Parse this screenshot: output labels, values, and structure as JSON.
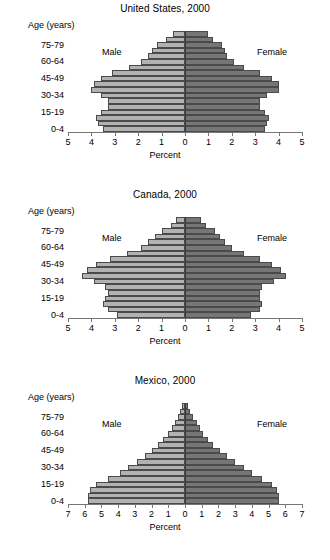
{
  "figure": {
    "axis_titles": {
      "x": "Percent",
      "y": "Age (years)"
    },
    "series_labels": {
      "male": "Male",
      "female": "Female"
    },
    "colors": {
      "male": "#b2b2b2",
      "female": "#767676",
      "outline": "#4a4a4a",
      "axis": "#777777"
    }
  },
  "chart_data": [
    {
      "type": "bar",
      "title": "United States, 2000",
      "xlabel": "Percent",
      "ylabel": "Age (years)",
      "orientation": "population-pyramid",
      "xlim": [
        -5,
        5
      ],
      "xticks": [
        5,
        4,
        3,
        2,
        1,
        0,
        1,
        2,
        3,
        4,
        5
      ],
      "grid": false,
      "legend": "inline",
      "categories": [
        "0-4",
        "5-9",
        "10-14",
        "15-19",
        "20-24",
        "25-29",
        "30-34",
        "35-39",
        "40-44",
        "45-49",
        "50-54",
        "55-59",
        "60-64",
        "65-69",
        "70-74",
        "75-79",
        "80-84",
        "85+"
      ],
      "ytick_labels": [
        "0-4",
        "15-19",
        "30-34",
        "45-49",
        "60-64",
        "75-79"
      ],
      "series": [
        {
          "name": "Male",
          "values": [
            3.5,
            3.7,
            3.8,
            3.6,
            3.3,
            3.3,
            3.6,
            4.0,
            3.9,
            3.6,
            3.1,
            2.4,
            1.9,
            1.6,
            1.4,
            1.2,
            0.8,
            0.5
          ]
        },
        {
          "name": "Female",
          "values": [
            3.4,
            3.5,
            3.6,
            3.4,
            3.2,
            3.2,
            3.5,
            4.0,
            4.0,
            3.7,
            3.2,
            2.5,
            2.1,
            1.8,
            1.7,
            1.6,
            1.2,
            1.0
          ]
        }
      ]
    },
    {
      "type": "bar",
      "title": "Canada, 2000",
      "xlabel": "Percent",
      "ylabel": "Age (years)",
      "orientation": "population-pyramid",
      "xlim": [
        -5,
        5
      ],
      "xticks": [
        5,
        4,
        3,
        2,
        1,
        0,
        1,
        2,
        3,
        4,
        5
      ],
      "grid": false,
      "legend": "inline",
      "categories": [
        "0-4",
        "5-9",
        "10-14",
        "15-19",
        "20-24",
        "25-29",
        "30-34",
        "35-39",
        "40-44",
        "45-49",
        "50-54",
        "55-59",
        "60-64",
        "65-69",
        "70-74",
        "75-79",
        "80-84",
        "85+"
      ],
      "ytick_labels": [
        "0-4",
        "15-19",
        "30-34",
        "45-49",
        "60-64",
        "75-79"
      ],
      "series": [
        {
          "name": "Male",
          "values": [
            2.9,
            3.3,
            3.5,
            3.4,
            3.3,
            3.4,
            3.9,
            4.4,
            4.2,
            3.8,
            3.2,
            2.5,
            1.9,
            1.6,
            1.3,
            1.0,
            0.6,
            0.4
          ]
        },
        {
          "name": "Female",
          "values": [
            2.8,
            3.2,
            3.3,
            3.2,
            3.2,
            3.3,
            3.8,
            4.3,
            4.1,
            3.7,
            3.2,
            2.5,
            2.0,
            1.7,
            1.5,
            1.3,
            0.9,
            0.7
          ]
        }
      ]
    },
    {
      "type": "bar",
      "title": "Mexico, 2000",
      "xlabel": "Percent",
      "ylabel": "Age (years)",
      "orientation": "population-pyramid",
      "xlim": [
        -7,
        7
      ],
      "xticks": [
        7,
        6,
        5,
        4,
        3,
        2,
        1,
        0,
        1,
        2,
        3,
        4,
        5,
        6,
        7
      ],
      "grid": false,
      "legend": "inline",
      "categories": [
        "0-4",
        "5-9",
        "10-14",
        "15-19",
        "20-24",
        "25-29",
        "30-34",
        "35-39",
        "40-44",
        "45-49",
        "50-54",
        "55-59",
        "60-64",
        "65-69",
        "70-74",
        "75-79",
        "80-84",
        "85+"
      ],
      "ytick_labels": [
        "0-4",
        "15-19",
        "30-34",
        "45-49",
        "60-64",
        "75-79"
      ],
      "series": [
        {
          "name": "Male",
          "values": [
            5.8,
            5.8,
            5.7,
            5.3,
            4.6,
            3.9,
            3.4,
            2.9,
            2.4,
            2.0,
            1.6,
            1.3,
            1.0,
            0.8,
            0.6,
            0.4,
            0.3,
            0.2
          ]
        },
        {
          "name": "Female",
          "values": [
            5.6,
            5.6,
            5.5,
            5.2,
            4.6,
            4.0,
            3.5,
            3.0,
            2.5,
            2.1,
            1.7,
            1.4,
            1.1,
            0.9,
            0.7,
            0.5,
            0.3,
            0.2
          ]
        }
      ]
    }
  ]
}
